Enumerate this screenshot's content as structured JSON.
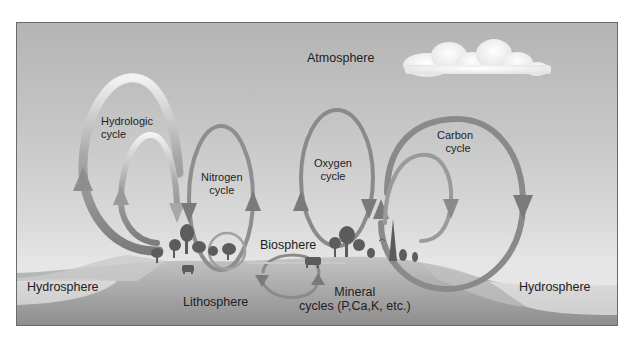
{
  "diagram": {
    "type": "biogeochemical-cycles",
    "spheres": {
      "atmosphere": "Atmosphere",
      "hydrosphere_left": "Hydrosphere",
      "hydrosphere_right": "Hydrosphere",
      "lithosphere": "Lithosphere",
      "biosphere": "Biosphere"
    },
    "cycles": {
      "hydrologic": {
        "line1": "Hydrologic",
        "line2": "cycle"
      },
      "nitrogen": {
        "line1": "Nitrogen",
        "line2": "cycle"
      },
      "oxygen": {
        "line1": "Oxygen",
        "line2": "cycle"
      },
      "carbon": {
        "line1": "Carbon",
        "line2": "cycle"
      },
      "mineral": {
        "line1": "Mineral",
        "line2": "cycles (P,Ca,K, etc.)"
      }
    },
    "colors": {
      "sky_top": "#b4b4b4",
      "sky_bottom": "#e6e6e6",
      "land": "#9e9e9e",
      "water": "#d6d6d6",
      "arrow": "#8a8a8a",
      "arrow_light": "#ececec",
      "cloud": "#fafafa",
      "vegetation": "#5a5a5a"
    }
  }
}
